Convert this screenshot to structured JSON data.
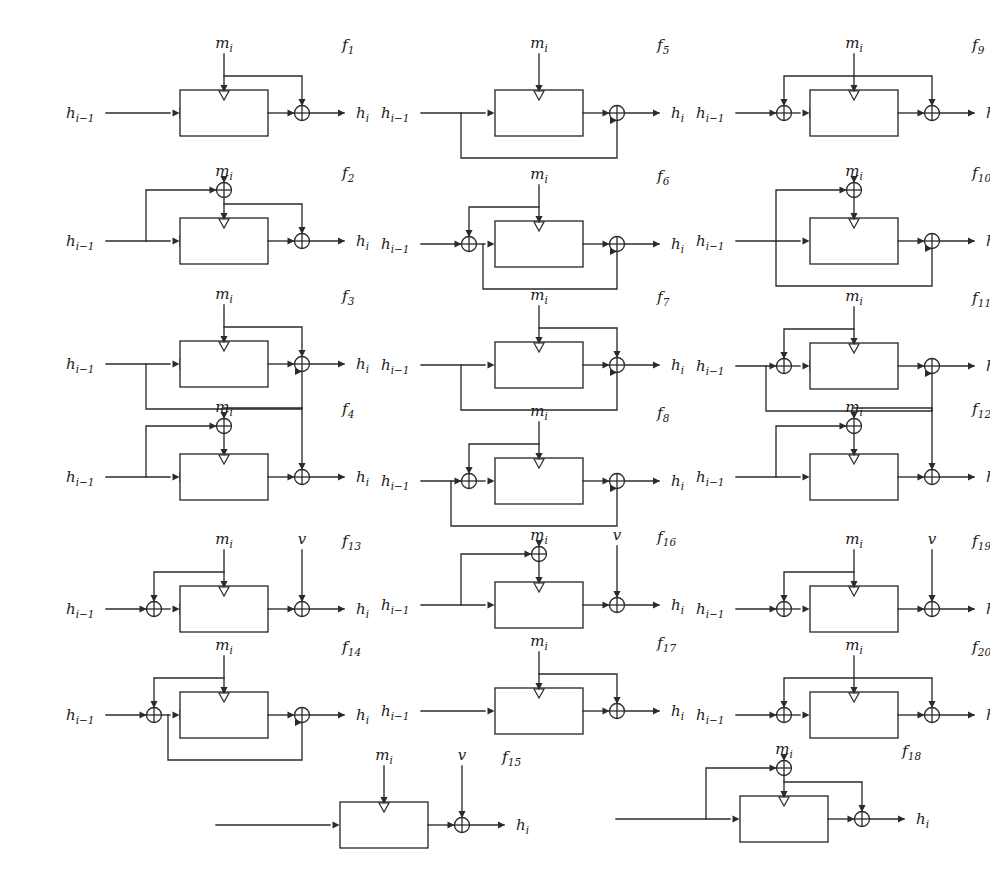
{
  "figure": {
    "canvas": {
      "width": 980,
      "height": 896
    },
    "labels": {
      "input_state": "h",
      "input_state_sub": "i−1",
      "output_state": "h",
      "output_state_sub": "i",
      "message": "m",
      "message_sub": "i",
      "constant": "v"
    },
    "columns": 3,
    "schemes": [
      {
        "id": "f1",
        "name": "f",
        "index": "1",
        "x": 60,
        "y": 32,
        "in_xor": false,
        "out_xor": true,
        "feedback_h": false,
        "m_to_xor": false,
        "m_tap_to_out_xor": true,
        "key_arrow": true,
        "v_input": false,
        "m_label": true
      },
      {
        "id": "f2",
        "name": "f",
        "index": "2",
        "x": 60,
        "y": 160,
        "in_xor": false,
        "out_xor": true,
        "feedback_h": false,
        "m_to_xor": true,
        "h_to_m_xor": true,
        "m_tap_to_out_xor": true,
        "key_arrow": true,
        "v_input": false,
        "m_label": true
      },
      {
        "id": "f3",
        "name": "f",
        "index": "3",
        "x": 60,
        "y": 283,
        "in_xor": false,
        "out_xor": true,
        "feedback_h": true,
        "m_to_xor": false,
        "m_tap_to_out_xor": true,
        "key_arrow": true,
        "v_input": false,
        "m_label": true
      },
      {
        "id": "f4",
        "name": "f",
        "index": "4",
        "x": 60,
        "y": 396,
        "in_xor": false,
        "out_xor": true,
        "feedback_h": false,
        "m_to_xor": true,
        "h_to_m_xor": true,
        "m_tap_high_to_out_xor": true,
        "key_arrow": true,
        "v_input": false,
        "m_label": true
      },
      {
        "id": "f5",
        "name": "f",
        "index": "5",
        "x": 375,
        "y": 32,
        "in_xor": false,
        "out_xor": true,
        "feedback_h": true,
        "m_to_xor": false,
        "m_tap_to_out_xor": false,
        "key_arrow": false,
        "v_input": false,
        "m_label": true
      },
      {
        "id": "f6",
        "name": "f",
        "index": "6",
        "x": 375,
        "y": 163,
        "in_xor": true,
        "out_xor": true,
        "feedback_h_from_inxor": true,
        "m_to_inxor": true,
        "key_arrow": false,
        "v_input": false,
        "m_label": true
      },
      {
        "id": "f7",
        "name": "f",
        "index": "7",
        "x": 375,
        "y": 284,
        "in_xor": false,
        "out_xor": true,
        "feedback_h": true,
        "m_to_xor": false,
        "m_tap_to_out_xor": true,
        "key_arrow": false,
        "v_input": false,
        "m_label": true
      },
      {
        "id": "f8",
        "name": "f",
        "index": "8",
        "x": 375,
        "y": 400,
        "in_xor": true,
        "out_xor": true,
        "feedback_h": true,
        "m_to_inxor": true,
        "key_arrow": false,
        "v_input": false,
        "m_label": true
      },
      {
        "id": "f9",
        "name": "f",
        "index": "9",
        "x": 690,
        "y": 32,
        "in_xor": true,
        "out_xor": true,
        "feedback_h": false,
        "m_to_inxor_tap": true,
        "m_tap_to_out_xor": true,
        "key_arrow": true,
        "v_input": false,
        "m_label": true
      },
      {
        "id": "f10",
        "name": "f",
        "index": "10",
        "x": 690,
        "y": 160,
        "in_xor": false,
        "out_xor": true,
        "feedback_h": true,
        "m_to_xor": true,
        "h_to_m_xor": true,
        "key_arrow": false,
        "v_input": false,
        "m_label": true
      },
      {
        "id": "f11",
        "name": "f",
        "index": "11",
        "x": 690,
        "y": 285,
        "in_xor": true,
        "out_xor": true,
        "feedback_h": true,
        "m_to_inxor": true,
        "key_arrow": true,
        "v_input": false,
        "m_label": true
      },
      {
        "id": "f12",
        "name": "f",
        "index": "12",
        "x": 690,
        "y": 396,
        "in_xor": false,
        "out_xor": true,
        "feedback_h": false,
        "m_to_xor": true,
        "h_to_m_xor": true,
        "m_tap_high_to_out_xor": true,
        "key_arrow": false,
        "v_input": false,
        "m_label": true
      },
      {
        "id": "f13",
        "name": "f",
        "index": "13",
        "x": 60,
        "y": 528,
        "in_xor": true,
        "out_xor": true,
        "feedback_h": false,
        "m_to_inxor_tap": true,
        "key_arrow": true,
        "v_input": true,
        "m_label": true
      },
      {
        "id": "f14",
        "name": "f",
        "index": "14",
        "x": 60,
        "y": 634,
        "in_xor": true,
        "out_xor": true,
        "feedback_h_from_inxor": true,
        "m_to_inxor_tap": true,
        "key_arrow": true,
        "v_input": false,
        "m_label": true
      },
      {
        "id": "f15",
        "name": "f",
        "index": "15",
        "x": 220,
        "y": 744,
        "in_xor": false,
        "out_xor": true,
        "feedback_h": false,
        "m_to_xor": false,
        "key_arrow": false,
        "v_input": true,
        "m_label": true,
        "no_h_in_label": true
      },
      {
        "id": "f16",
        "name": "f",
        "index": "16",
        "x": 375,
        "y": 524,
        "in_xor": false,
        "out_xor": true,
        "feedback_h": false,
        "m_to_xor": true,
        "h_to_m_xor": true,
        "key_arrow": false,
        "v_input": true,
        "m_label": true
      },
      {
        "id": "f17",
        "name": "f",
        "index": "17",
        "x": 375,
        "y": 630,
        "in_xor": false,
        "out_xor": true,
        "feedback_h": false,
        "m_to_xor": false,
        "m_tap_to_out_xor": true,
        "key_arrow": false,
        "v_input": false,
        "m_label": true
      },
      {
        "id": "f18",
        "name": "f",
        "index": "18",
        "x": 620,
        "y": 738,
        "in_xor": false,
        "out_xor": true,
        "feedback_h": false,
        "m_to_xor": true,
        "h_to_m_xor": true,
        "m_tap_to_out_xor": true,
        "key_arrow": false,
        "v_input": false,
        "m_label": true,
        "no_h_in_label": true
      },
      {
        "id": "f19",
        "name": "f",
        "index": "19",
        "x": 690,
        "y": 528,
        "in_xor": true,
        "out_xor": true,
        "feedback_h": false,
        "m_to_inxor_tap": true,
        "key_arrow": false,
        "v_input": true,
        "m_label": true
      },
      {
        "id": "f20",
        "name": "f",
        "index": "20",
        "x": 690,
        "y": 634,
        "in_xor": true,
        "out_xor": true,
        "feedback_h": false,
        "m_to_inxor_tap": true,
        "m_tap_to_out_xor": true,
        "key_arrow": false,
        "v_input": false,
        "m_label": true
      }
    ]
  }
}
